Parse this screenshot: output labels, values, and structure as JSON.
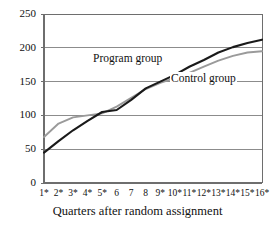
{
  "chart_data": {
    "type": "line",
    "title": "",
    "xlabel": "Quarters after random assignment",
    "ylabel": "",
    "ylim": [
      0,
      250
    ],
    "ytick_values": [
      0,
      50,
      100,
      150,
      200,
      250
    ],
    "ytick_labels": [
      "0",
      "50",
      "100",
      "150",
      "200",
      "250"
    ],
    "grid": "horizontal",
    "legend_position": "inline-annotations",
    "x": [
      1,
      2,
      3,
      4,
      5,
      6,
      7,
      8,
      9,
      10,
      11,
      12,
      13,
      14,
      15,
      16
    ],
    "categories": [
      "1*",
      "2*",
      "3*",
      "4*",
      "5*",
      "6",
      "7",
      "8",
      "9*",
      "10*",
      "11*",
      "12*",
      "13*",
      "14*",
      "15*",
      "16*"
    ],
    "significance_marker": "*",
    "series": [
      {
        "name": "Program group",
        "color": "#1a1a1a",
        "values": [
          45,
          62,
          78,
          92,
          105,
          108,
          123,
          140,
          150,
          160,
          172,
          182,
          193,
          201,
          207,
          212
        ]
      },
      {
        "name": "Control group",
        "color": "#9a9a9a",
        "values": [
          68,
          88,
          97,
          100,
          103,
          113,
          126,
          139,
          148,
          155,
          163,
          172,
          181,
          188,
          193,
          195
        ]
      }
    ],
    "annotations": [
      {
        "text": "Program group",
        "series": "Program group"
      },
      {
        "text": "Control group",
        "series": "Control group"
      }
    ]
  },
  "axis": {
    "y_labels": [
      "250",
      "200",
      "150",
      "100",
      "50",
      "0"
    ],
    "x_labels": [
      "1*",
      "2*",
      "3*",
      "4*",
      "5*",
      "6",
      "7",
      "8",
      "9*",
      "10*",
      "11*",
      "12*",
      "13*",
      "14*",
      "15*",
      "16*"
    ],
    "x_title": "Quarters after random assignment"
  },
  "labels": {
    "program": "Program group",
    "control": "Control group"
  },
  "colors": {
    "program_line": "#1a1a1a",
    "control_line": "#9a9a9a",
    "grid": "#8c8c8c",
    "frame": "#6e6e6e",
    "background": "#ffffff"
  }
}
